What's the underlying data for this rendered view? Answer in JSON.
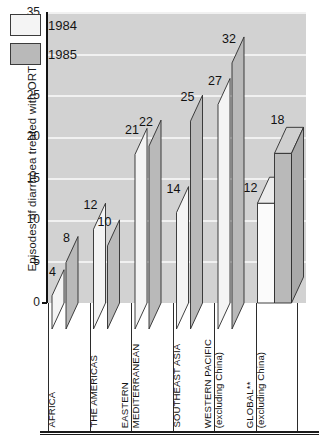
{
  "chart_data": {
    "type": "bar",
    "title": "",
    "xlabel": "",
    "ylabel": "Episodes of diarrhoea treated with ORT (%)",
    "ylim": [
      0,
      35
    ],
    "yticks": [
      "0",
      "5",
      "10",
      "15",
      "20",
      "25",
      "30",
      "35"
    ],
    "grid": true,
    "legend_position": "top-left",
    "categories": [
      "AFRICA",
      "THE AMERICAS",
      "EASTERN MEDITERRANEAN",
      "SOUTHEAST ASIA",
      "WESTERN PACIFIC (excluding China)",
      "GLOBAL** (excluding China)"
    ],
    "category_lines": [
      [
        "AFRICA"
      ],
      [
        "THE AMERICAS"
      ],
      [
        "EASTERN",
        "MEDITERRANEAN"
      ],
      [
        "SOUTHEAST ASIA"
      ],
      [
        "WESTERN PACIFIC",
        "(excluding China)"
      ],
      [
        "GLOBAL**",
        "(excluding China)"
      ]
    ],
    "series": [
      {
        "name": "1984",
        "values": [
          4,
          12,
          21,
          14,
          27,
          12
        ],
        "color": "#f4f4f4"
      },
      {
        "name": "1985",
        "values": [
          8,
          10,
          22,
          25,
          32,
          18
        ],
        "color": "#b9b9b9"
      }
    ],
    "value_labels": [
      "4",
      "8",
      "12",
      "10",
      "21",
      "22",
      "14",
      "25",
      "27",
      "32",
      "12",
      "18"
    ]
  },
  "legend": {
    "items": [
      {
        "label": "1984",
        "swatch": "#f4f4f4"
      },
      {
        "label": "1985",
        "swatch": "#b9b9b9"
      }
    ]
  },
  "axis": {
    "y_title": "Episodes of diarrhoea treated with ORT (%)",
    "y_ticks": [
      "35",
      "30",
      "25",
      "20",
      "15",
      "10",
      "5",
      "0"
    ]
  },
  "colors": {
    "plot_background": "#d2d2d2",
    "gridline": "#f1f1f1",
    "bar_1984": "#f4f4f4",
    "bar_1985": "#b9b9b9",
    "outline": "#2b2b2b",
    "text": "#131313"
  }
}
